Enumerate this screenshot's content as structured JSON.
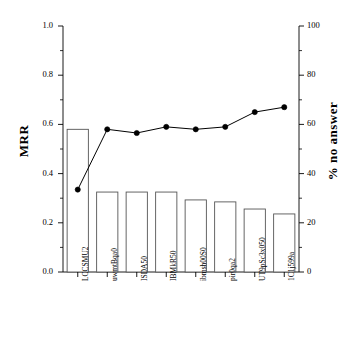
{
  "chart_data": {
    "type": "bar",
    "title": "",
    "xlabel": "",
    "ylabel": "MRR",
    "y2label": "% no answer",
    "categories": [
      "LCCSMU2",
      "uwmtBqa0",
      "ISDA50",
      "IBMkR50",
      "ibmsh00S0",
      "pir0qa2",
      "UT9pSc3x050",
      "1C1j599a"
    ],
    "series": [
      {
        "name": "MRR",
        "type": "bar",
        "axis": "left",
        "values": [
          0.58,
          0.325,
          0.325,
          0.325,
          0.293,
          0.285,
          0.256,
          0.236
        ]
      },
      {
        "name": "% no answer",
        "type": "line",
        "axis": "right",
        "values": [
          33.5,
          58.0,
          56.5,
          59.0,
          58.0,
          59.0,
          65.0,
          67.0
        ]
      }
    ],
    "ylim": [
      0.0,
      1.0
    ],
    "y2lim": [
      0,
      100
    ],
    "yticks": [
      "0.0",
      "0.2",
      "0.4",
      "0.6",
      "0.8",
      "1.0"
    ],
    "ytick_values": [
      0.0,
      0.2,
      0.4,
      0.6,
      0.8,
      1.0
    ],
    "y2ticks": [
      "0",
      "20",
      "40",
      "60",
      "80",
      "100"
    ],
    "y2tick_values": [
      0,
      20,
      40,
      60,
      80,
      100
    ],
    "grid": false,
    "legend": "none",
    "colors": {
      "axis": "#000000",
      "bar_edge": "#555555",
      "bar_fill": "#ffffff",
      "line": "#000000",
      "marker": "#000000",
      "background": "#ffffff"
    }
  }
}
